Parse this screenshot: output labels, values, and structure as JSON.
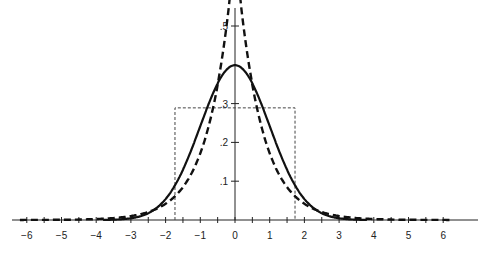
{
  "chart_data": {
    "type": "line",
    "title": "",
    "xlabel": "",
    "ylabel": "",
    "xlim": [
      -6.2,
      6.5
    ],
    "ylim": [
      0,
      0.5
    ],
    "grid": false,
    "legend": null,
    "x_ticks": [
      -6,
      -5,
      -4,
      -3,
      -2,
      -1,
      0,
      1,
      2,
      3,
      4,
      5,
      6
    ],
    "x_tick_labels": [
      "-6",
      "-5",
      "-4",
      "-3",
      "-2",
      "-1",
      "0",
      "1",
      "2",
      "3",
      "4",
      "5",
      "6"
    ],
    "y_ticks": [
      0.1,
      0.2,
      0.3,
      0.5
    ],
    "y_tick_labels": [
      ".1",
      ".2",
      ".3",
      ".5"
    ],
    "series": [
      {
        "name": "normal density",
        "style": "solid",
        "distribution": "Normal(0,1)",
        "x": [
          -4,
          -3,
          -2,
          -1.5,
          -1,
          -0.5,
          0,
          0.5,
          1,
          1.5,
          2,
          3,
          4
        ],
        "y": [
          0.0001,
          0.004,
          0.054,
          0.13,
          0.242,
          0.352,
          0.399,
          0.352,
          0.242,
          0.13,
          0.054,
          0.004,
          0.0001
        ]
      },
      {
        "name": "laplace density",
        "style": "dashed",
        "distribution": "Laplace(0,1/sqrt2)",
        "x": [
          -6,
          -5,
          -4,
          -3,
          -2,
          -1.5,
          -1,
          -0.5,
          0,
          0.5,
          1,
          1.5,
          2,
          3,
          4,
          5,
          6
        ],
        "y": [
          0.0001,
          0.0006,
          0.002,
          0.01,
          0.042,
          0.085,
          0.172,
          0.347,
          0.5,
          0.347,
          0.172,
          0.085,
          0.042,
          0.01,
          0.002,
          0.0006,
          0.0001
        ]
      },
      {
        "name": "uniform density",
        "style": "dotted",
        "distribution": "Uniform(-1.73,1.73)",
        "x": [
          -1.73,
          -1.73,
          1.73,
          1.73
        ],
        "y": [
          0,
          0.289,
          0.289,
          0
        ]
      }
    ]
  },
  "colors": {
    "axis": "#222222",
    "curve": "#111111",
    "rect": "#444444"
  }
}
